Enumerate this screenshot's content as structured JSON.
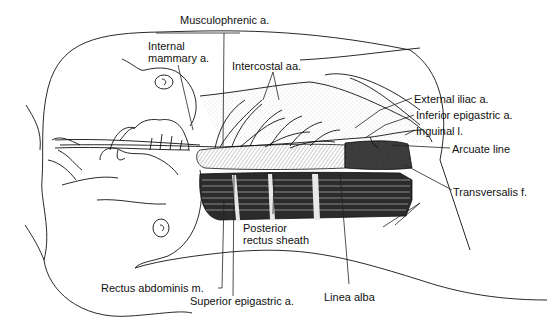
{
  "figure": {
    "type": "anatomical line drawing",
    "labels": [
      {
        "id": "musculophrenic",
        "text": "Musculophrenic a."
      },
      {
        "id": "internal_mammary_1",
        "text": "Internal"
      },
      {
        "id": "internal_mammary_2",
        "text": "mammary a."
      },
      {
        "id": "intercostal",
        "text": "Intercostal aa."
      },
      {
        "id": "external_iliac",
        "text": "External iliac a."
      },
      {
        "id": "inferior_epigastric",
        "text": "Inferior epigastric a."
      },
      {
        "id": "inguinal",
        "text": "Inguinal l."
      },
      {
        "id": "arcuate",
        "text": "Arcuate line"
      },
      {
        "id": "transversalis",
        "text": "Transversalis f."
      },
      {
        "id": "posterior_sheath_1",
        "text": "Posterior"
      },
      {
        "id": "posterior_sheath_2",
        "text": "rectus sheath"
      },
      {
        "id": "rectus_abdominis",
        "text": "Rectus abdominis m."
      },
      {
        "id": "superior_epigastric",
        "text": "Superior epigastric a."
      },
      {
        "id": "linea_alba",
        "text": "Linea alba"
      }
    ]
  }
}
